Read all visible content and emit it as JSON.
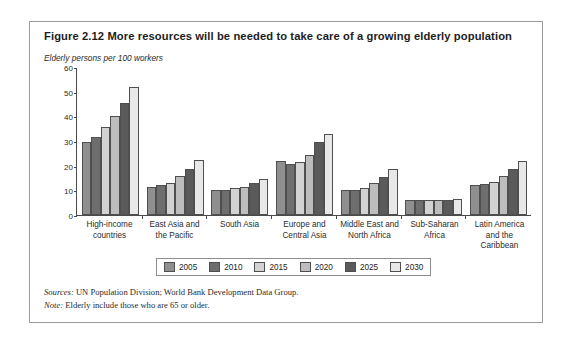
{
  "figure": {
    "title": "Figure 2.12  More resources will be needed to take care of a growing elderly population",
    "axis_caption": "Elderly persons per 100 workers",
    "sources_label": "Sources:",
    "sources_text": " UN Population Division; World Bank Development Data Group.",
    "note_label": "Note:",
    "note_text": " Elderly include those who are 65 or older."
  },
  "chart_data": {
    "type": "bar",
    "title": "Figure 2.12  More resources will be needed to take care of a growing elderly population",
    "xlabel": "",
    "ylabel": "Elderly persons per 100 workers",
    "ylim": [
      0,
      60
    ],
    "yticks": [
      0,
      10,
      20,
      30,
      40,
      50,
      60
    ],
    "grid": false,
    "legend_position": "bottom",
    "categories": [
      "High-income countries",
      "East Asia and the Pacific",
      "South Asia",
      "Europe and Central Asia",
      "Middle East and North Africa",
      "Sub-Saharan Africa",
      "Latin America and the Caribbean"
    ],
    "series": [
      {
        "name": "2005",
        "color": "#8f8f8f",
        "values": [
          29.5,
          11.5,
          10.0,
          22.0,
          10.2,
          6.0,
          12.0
        ]
      },
      {
        "name": "2010",
        "color": "#6e6e6e",
        "values": [
          31.5,
          12.0,
          10.2,
          20.5,
          10.2,
          6.0,
          12.5
        ]
      },
      {
        "name": "2015",
        "color": "#d2d2d2",
        "values": [
          35.5,
          13.0,
          10.8,
          21.5,
          11.0,
          6.0,
          13.5
        ]
      },
      {
        "name": "2020",
        "color": "#bdbdbd",
        "values": [
          40.0,
          16.0,
          11.5,
          24.5,
          13.0,
          6.0,
          16.0
        ]
      },
      {
        "name": "2025",
        "color": "#5a5a5a",
        "values": [
          45.5,
          18.8,
          12.8,
          29.5,
          15.5,
          6.2,
          18.5
        ]
      },
      {
        "name": "2030",
        "color": "#e8e8e8",
        "values": [
          52.0,
          22.5,
          14.5,
          33.0,
          18.5,
          6.5,
          22.0
        ]
      }
    ]
  }
}
